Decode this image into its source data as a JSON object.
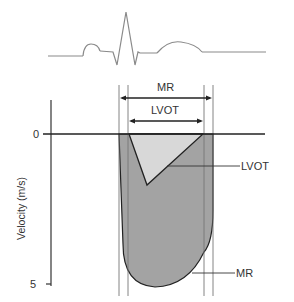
{
  "diagram": {
    "type": "doppler-velocity-diagram",
    "ecg": {
      "label": "ECG tracing"
    },
    "axis": {
      "ylabel": "Velocity (m/s)",
      "ticks": [
        {
          "value": "0"
        },
        {
          "value": "5"
        }
      ]
    },
    "intervals": {
      "mr": {
        "label": "MR"
      },
      "lvot": {
        "label": "LVOT"
      }
    },
    "callouts": {
      "lvot": "LVOT",
      "mr": "MR"
    },
    "colors": {
      "mr_fill": "#a3a3a3",
      "lvot_fill": "#d8d8d8",
      "line": "#333333",
      "ecg": "#8a8a8a",
      "guide": "#777777"
    }
  }
}
